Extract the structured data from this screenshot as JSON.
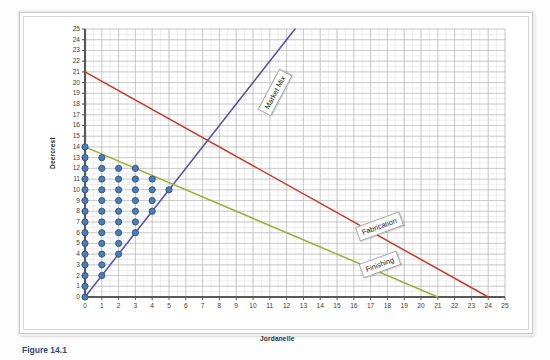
{
  "figure": {
    "caption": "Figure 14.1"
  },
  "chart_data": {
    "type": "scatter",
    "title": "",
    "xlabel": "Jordanelle",
    "ylabel": "Deercrest",
    "xlim": [
      0,
      25
    ],
    "ylim": [
      0,
      25
    ],
    "xticks": [
      0,
      1,
      2,
      3,
      4,
      5,
      6,
      7,
      8,
      9,
      10,
      11,
      12,
      13,
      14,
      15,
      16,
      17,
      18,
      19,
      20,
      21,
      22,
      23,
      24,
      25
    ],
    "yticks": [
      0,
      1,
      2,
      3,
      4,
      5,
      6,
      7,
      8,
      9,
      10,
      11,
      12,
      13,
      14,
      15,
      16,
      17,
      18,
      19,
      20,
      21,
      22,
      23,
      24,
      25
    ],
    "grid": true,
    "legend_position": "inline-callout",
    "point_color": "#4a7ebb",
    "point_edge_color": "#2b5279",
    "points": [
      {
        "x": 0,
        "y": 0
      },
      {
        "x": 0,
        "y": 1
      },
      {
        "x": 0,
        "y": 2
      },
      {
        "x": 0,
        "y": 3
      },
      {
        "x": 0,
        "y": 4
      },
      {
        "x": 0,
        "y": 5
      },
      {
        "x": 0,
        "y": 6
      },
      {
        "x": 0,
        "y": 7
      },
      {
        "x": 0,
        "y": 8
      },
      {
        "x": 0,
        "y": 9
      },
      {
        "x": 0,
        "y": 10
      },
      {
        "x": 0,
        "y": 11
      },
      {
        "x": 0,
        "y": 12
      },
      {
        "x": 0,
        "y": 13
      },
      {
        "x": 0,
        "y": 14
      },
      {
        "x": 1,
        "y": 2
      },
      {
        "x": 1,
        "y": 3
      },
      {
        "x": 1,
        "y": 4
      },
      {
        "x": 1,
        "y": 5
      },
      {
        "x": 1,
        "y": 6
      },
      {
        "x": 1,
        "y": 7
      },
      {
        "x": 1,
        "y": 8
      },
      {
        "x": 1,
        "y": 9
      },
      {
        "x": 1,
        "y": 10
      },
      {
        "x": 1,
        "y": 11
      },
      {
        "x": 1,
        "y": 12
      },
      {
        "x": 1,
        "y": 13
      },
      {
        "x": 2,
        "y": 4
      },
      {
        "x": 2,
        "y": 5
      },
      {
        "x": 2,
        "y": 6
      },
      {
        "x": 2,
        "y": 7
      },
      {
        "x": 2,
        "y": 8
      },
      {
        "x": 2,
        "y": 9
      },
      {
        "x": 2,
        "y": 10
      },
      {
        "x": 2,
        "y": 11
      },
      {
        "x": 2,
        "y": 12
      },
      {
        "x": 3,
        "y": 6
      },
      {
        "x": 3,
        "y": 7
      },
      {
        "x": 3,
        "y": 8
      },
      {
        "x": 3,
        "y": 9
      },
      {
        "x": 3,
        "y": 10
      },
      {
        "x": 3,
        "y": 11
      },
      {
        "x": 3,
        "y": 12
      },
      {
        "x": 4,
        "y": 8
      },
      {
        "x": 4,
        "y": 9
      },
      {
        "x": 4,
        "y": 10
      },
      {
        "x": 4,
        "y": 11
      },
      {
        "x": 5,
        "y": 10
      }
    ],
    "lines": [
      {
        "name": "Market Mix",
        "label": "Market Mix",
        "color": "#5b4e9e",
        "x1": 0,
        "y1": 0,
        "x2": 12.5,
        "y2": 25
      },
      {
        "name": "Fabrication",
        "label": "Fabrication",
        "color": "#c0392b",
        "x1": 0,
        "y1": 21,
        "x2": 24,
        "y2": 0
      },
      {
        "name": "Finishing",
        "label": "Finishing",
        "color": "#9aae3a",
        "x1": 0,
        "y1": 14,
        "x2": 21,
        "y2": 0
      }
    ]
  },
  "colors": {
    "grid_minor": "#dcdcdc",
    "grid_major": "#b4b4b4",
    "axis": "#595959",
    "frame": "#c9c9c9",
    "caption": "#2e4a7d"
  }
}
